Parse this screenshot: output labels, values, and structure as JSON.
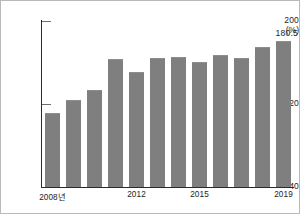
{
  "chart_data": {
    "type": "bar",
    "title": "",
    "xlabel": "",
    "ylabel": "",
    "unit_label": "(%)",
    "ylim": [
      40,
      200
    ],
    "grid": false,
    "legend": null,
    "y_ticks": [
      {
        "value": 200,
        "label": "200"
      },
      {
        "value": 120,
        "label": "120"
      },
      {
        "value": 40,
        "label": "40"
      }
    ],
    "categories": [
      "2008",
      "2009",
      "2010",
      "2011",
      "2012",
      "2013",
      "2014",
      "2015",
      "2016",
      "2017",
      "2018",
      "2019"
    ],
    "x_tick_labels": [
      {
        "index": 0,
        "label": "2008년"
      },
      {
        "index": 4,
        "label": "2012"
      },
      {
        "index": 7,
        "label": "2015"
      },
      {
        "index": 11,
        "label": "2019"
      }
    ],
    "values": [
      111.0,
      123.5,
      133.5,
      163.0,
      150.5,
      164.5,
      165.0,
      160.5,
      167.0,
      164.5,
      175.0,
      180.5
    ],
    "data_labels": [
      {
        "index": 11,
        "text": "180.5"
      }
    ],
    "colors": {
      "bar": "#7f7f7f",
      "axis": "#2b2b2b",
      "text": "#232323",
      "background": "#ffffff",
      "border": "#b9b9b9"
    }
  }
}
